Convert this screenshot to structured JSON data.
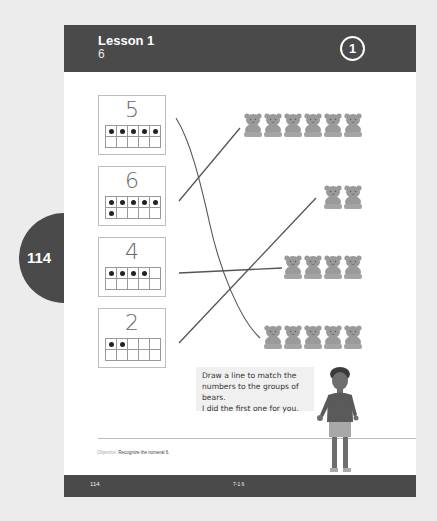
{
  "header": {
    "lesson_title": "Lesson 1",
    "lesson_subtitle": "6",
    "step_number": "1"
  },
  "side_tab": {
    "page_number": "114"
  },
  "cards": [
    {
      "numeral": "5",
      "dots": 5
    },
    {
      "numeral": "6",
      "dots": 6
    },
    {
      "numeral": "4",
      "dots": 4
    },
    {
      "numeral": "2",
      "dots": 2
    }
  ],
  "bear_groups": [
    {
      "count": 6
    },
    {
      "count": 2
    },
    {
      "count": 4
    },
    {
      "count": 5
    }
  ],
  "instruction": {
    "line1": "Draw a line to match the",
    "line2": "numbers to the groups of bears.",
    "line3": "I did the first one for you."
  },
  "objective": {
    "label": "Objective:",
    "text": "Recognize the numeral 6."
  },
  "footer": {
    "page_number": "114",
    "code": "7-1  6"
  },
  "colors": {
    "header_bg": "#4a4a4a",
    "bear": "#9a9a9a",
    "line": "#555555"
  }
}
